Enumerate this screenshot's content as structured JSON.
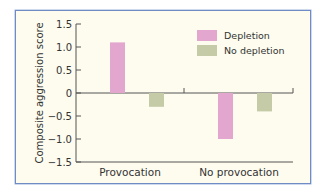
{
  "chart_data": {
    "type": "bar",
    "title": "",
    "xlabel": "",
    "ylabel": "Composite aggression score",
    "ylim": [
      -1.5,
      1.5
    ],
    "yticks": [
      "1.5",
      "1.0",
      "0.5",
      "0",
      "−0.5",
      "−1.0",
      "−1.5"
    ],
    "categories": [
      "Provocation",
      "No provocation"
    ],
    "series": [
      {
        "name": "Depletion",
        "color": "#e3a6cf",
        "values": [
          1.1,
          -1.0
        ]
      },
      {
        "name": "No depletion",
        "color": "#c4cba6",
        "values": [
          -0.3,
          -0.4
        ]
      }
    ],
    "legend_position": "upper right",
    "grid": false
  }
}
